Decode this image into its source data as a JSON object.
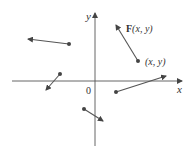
{
  "diagram": {
    "axes": {
      "x_label": "x",
      "y_label": "y",
      "origin_label": "0"
    },
    "labels": {
      "vector_label_bold": "F",
      "vector_label_args": "(x, y)",
      "point_label": "(x, y)"
    },
    "colors": {
      "axis": "#444444",
      "vector": "#555555",
      "dot": "#444444"
    },
    "vectors": [
      {
        "tail": [
          69,
          44
        ],
        "head": [
          28,
          39
        ]
      },
      {
        "tail": [
          60,
          74
        ],
        "head": [
          46,
          90
        ]
      },
      {
        "tail": [
          138,
          61
        ],
        "head": [
          116,
          25
        ]
      },
      {
        "tail": [
          116,
          92
        ],
        "head": [
          166,
          76
        ]
      },
      {
        "tail": [
          84,
          109
        ],
        "head": [
          103,
          121
        ]
      }
    ]
  }
}
